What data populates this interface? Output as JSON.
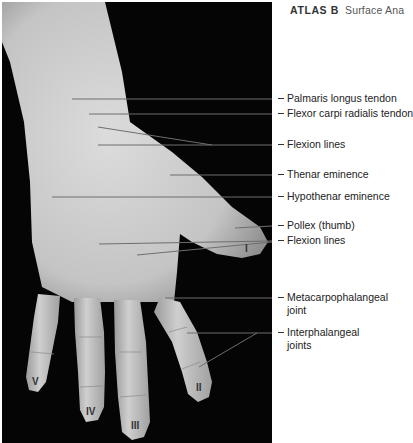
{
  "header": {
    "atlas": "ATLAS B",
    "title": "Surface Ana"
  },
  "labels": [
    {
      "id": "palmaris-longus-tendon",
      "text": "Palmaris longus tendon",
      "y": 87
    },
    {
      "id": "flexor-carpi-radialis-tendon",
      "text": "Flexor carpi radialis tendon",
      "y": 103
    },
    {
      "id": "flexion-lines-wrist",
      "text": "Flexion lines",
      "y": 137
    },
    {
      "id": "thenar-eminence",
      "text": "Thenar eminence",
      "y": 165
    },
    {
      "id": "hypothenar-eminence",
      "text": "Hypothenar eminence",
      "y": 187
    },
    {
      "id": "pollex-thumb",
      "text": "Pollex (thumb)",
      "y": 218
    },
    {
      "id": "flexion-lines-palm",
      "text": "Flexion lines",
      "y": 234
    },
    {
      "id": "metacarpophalangeal-joint",
      "text": "Metacarpophalangeal\njoint",
      "line1": "Metacarpophalangeal",
      "line2": "joint",
      "y": 287
    },
    {
      "id": "interphalangeal-joints",
      "text": "Interphalangeal\njoints",
      "line1": "Interphalangeal",
      "line2": "joints",
      "y": 325
    }
  ],
  "fingers": [
    {
      "numeral": "I",
      "x": 245,
      "y": 246
    },
    {
      "numeral": "II",
      "x": 196,
      "y": 386
    },
    {
      "numeral": "III",
      "x": 132,
      "y": 420
    },
    {
      "numeral": "IV",
      "x": 86,
      "y": 405
    },
    {
      "numeral": "V",
      "x": 31,
      "y": 376
    }
  ],
  "colors": {
    "background": "#ffffff",
    "photo_bg": "#050505",
    "skin_light": "#d9d9d9",
    "skin_mid": "#b8b8b8",
    "leader_line": "#6e6e6e",
    "text": "#222222"
  }
}
